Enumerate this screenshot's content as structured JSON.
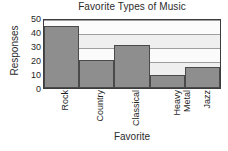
{
  "chart_data": {
    "type": "bar",
    "title": "Favorite Types of Music",
    "xlabel": "Favorite",
    "ylabel": "Responses",
    "categories": [
      "Rock",
      "Country",
      "Classical",
      "Heavy Metal",
      "Jazz"
    ],
    "values": [
      44,
      20,
      31,
      9,
      15
    ],
    "ylim": [
      0,
      50
    ],
    "yticks": [
      0,
      10,
      20,
      30,
      40,
      50
    ],
    "ytick_labels": [
      "0",
      "10",
      "20",
      "30",
      "40",
      "50"
    ],
    "grid": true,
    "legend": null,
    "colors": {
      "bar_fill": "#8e8e8e",
      "bar_edge": "#4a4a4a",
      "plot_background": "#fbfbfb",
      "gridline": "#9e9e9e",
      "band": "#efefef",
      "axis": "#3c3c3c",
      "text": "#1f1f1f"
    }
  }
}
